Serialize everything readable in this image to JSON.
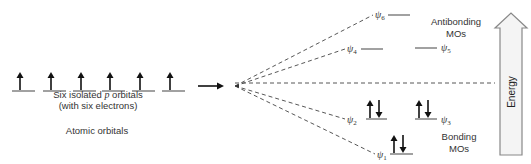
{
  "atomic": {
    "caption_line1_pre": "Six isolated ",
    "caption_line1_p": "p",
    "caption_line1_post": " orbitals",
    "caption_line2": "(with six electrons)",
    "title": "Atomic orbitals",
    "orbitals": [
      {
        "x1": 12,
        "x2": 35,
        "y": 91,
        "electrons": [
          "up"
        ]
      },
      {
        "x1": 43,
        "x2": 66,
        "y": 91,
        "electrons": [
          "up"
        ]
      },
      {
        "x1": 73,
        "x2": 96,
        "y": 91,
        "electrons": [
          "up"
        ]
      },
      {
        "x1": 102,
        "x2": 125,
        "y": 91,
        "electrons": [
          "up"
        ]
      },
      {
        "x1": 132,
        "x2": 155,
        "y": 91,
        "electrons": [
          "up"
        ]
      },
      {
        "x1": 162,
        "x2": 185,
        "y": 91,
        "electrons": [
          "up"
        ]
      }
    ]
  },
  "reaction_arrow": {
    "x1": 198,
    "x2": 224,
    "y": 86
  },
  "convergence_point": {
    "x": 235,
    "y": 86
  },
  "molecular_orbitals": [
    {
      "name": "ψ",
      "sub": "6",
      "label_x": 375,
      "label_y": 18,
      "x1": 388,
      "x2": 410,
      "y": 15,
      "dash_to_x": 373,
      "dash_to_y": 15,
      "electrons": []
    },
    {
      "name": "ψ",
      "sub": "4",
      "label_x": 347,
      "label_y": 52,
      "x1": 361,
      "x2": 383,
      "y": 49,
      "dash_to_x": 345,
      "dash_to_y": 49,
      "electrons": []
    },
    {
      "name": "ψ",
      "sub": "5",
      "label_x": 441,
      "label_y": 51,
      "x1": 415,
      "x2": 437,
      "y": 48,
      "electrons": []
    },
    {
      "name": "ψ",
      "sub": "2",
      "label_x": 347,
      "label_y": 123,
      "x1": 366,
      "x2": 387,
      "y": 119,
      "dash_to_x": 345,
      "dash_to_y": 119,
      "electrons": [
        "up",
        "down"
      ]
    },
    {
      "name": "ψ",
      "sub": "3",
      "label_x": 441,
      "label_y": 123,
      "x1": 415,
      "x2": 437,
      "y": 119,
      "electrons": [
        "up",
        "down"
      ]
    },
    {
      "name": "ψ",
      "sub": "1",
      "label_x": 377,
      "label_y": 158,
      "x1": 390,
      "x2": 413,
      "y": 154,
      "dash_to_x": 375,
      "dash_to_y": 154,
      "electrons": [
        "up",
        "down"
      ]
    }
  ],
  "nonbonding_line": {
    "x1": 235,
    "x2": 495,
    "y": 83
  },
  "labels": {
    "antibonding_line1": "Antibonding",
    "antibonding_line2": "MOs",
    "bonding_line1": "Bonding",
    "bonding_line2": "MOs"
  },
  "energy_arrow": {
    "label": "Energy",
    "shaft_x1": 500,
    "shaft_x2": 522,
    "shaft_top": 28,
    "shaft_bottom": 155,
    "head_left": 495,
    "head_right": 527,
    "tip_y": 13,
    "fill": "#f4f4f4",
    "stroke": "#888888"
  }
}
